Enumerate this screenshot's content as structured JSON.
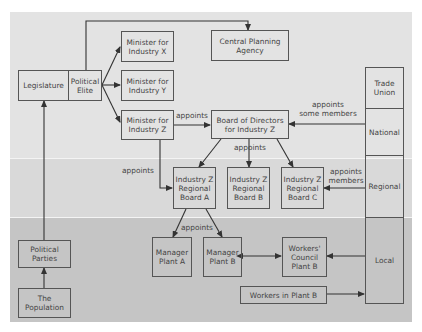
{
  "diagram": {
    "colors": {
      "background": "#ffffff",
      "national_band": "#e3e3e3",
      "regional_band": "#d9d9d9",
      "local_band": "#c5c5c5",
      "lines": "#333333",
      "text": "#444444"
    },
    "nodes": {
      "legislature": "Legislature",
      "political_elite": "Political\nElite",
      "minister_x": "Minister for\nIndustry X",
      "minister_y": "Minister for\nIndustry Y",
      "minister_z": "Minister for\nIndustry Z",
      "central_planning": "Central Planning\nAgency",
      "board_of_directors": "Board of Directors\nfor Industry Z",
      "regional_a": "Industry Z\nRegional\nBoard A",
      "regional_b": "Industry Z\nRegional\nBoard B",
      "regional_c": "Industry Z\nRegional\nBoard C",
      "manager_a": "Manager\nPlant A",
      "manager_b": "Manager\nPlant B",
      "workers_council": "Workers'\nCouncil\nPlant B",
      "workers_in_plant": "Workers in Plant B",
      "political_parties": "Political\nParties",
      "population": "The\nPopulation"
    },
    "trade_union": {
      "title": "Trade\nUnion",
      "levels": [
        "National",
        "Regional",
        "Local"
      ]
    },
    "edge_labels": {
      "minister_to_board": "appoints",
      "union_to_board": "appoints\nsome members",
      "board_to_regional": "appoints",
      "minister_to_regional": "appoints",
      "union_to_regional": "appoints\nmembers",
      "regional_to_managers": "appoints"
    }
  }
}
